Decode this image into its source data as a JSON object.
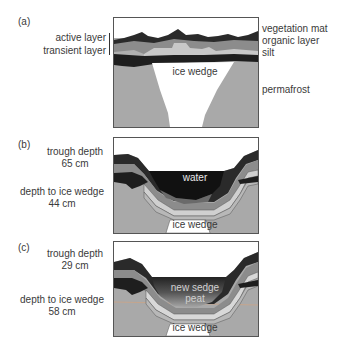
{
  "panels": [
    {
      "id": "a",
      "tag": "(a)",
      "left_labels": [
        "active layer",
        "transient layer"
      ],
      "right_labels": [
        "vegetation mat",
        "organic layer",
        "silt",
        "permafrost"
      ],
      "inner_labels": [
        "ice wedge"
      ]
    },
    {
      "id": "b",
      "tag": "(b)",
      "trough_depth_label": "trough depth",
      "trough_depth_value": "65 cm",
      "ice_depth_label": "depth to ice wedge",
      "ice_depth_value": "44 cm",
      "inner_labels": [
        "water",
        "ice wedge"
      ]
    },
    {
      "id": "c",
      "tag": "(c)",
      "trough_depth_label": "trough depth",
      "trough_depth_value": "29 cm",
      "ice_depth_label": "depth to ice wedge",
      "ice_depth_value": "58 cm",
      "inner_labels": [
        "new sedge",
        "peat",
        "ice wedge"
      ]
    }
  ],
  "colors": {
    "permafrost": "#a9a9a9",
    "vegetation": "#2a2a2a",
    "organic": "#8c8c8c",
    "silt_light": "#c8c8c8",
    "transient": "#1e1e1e",
    "ice": "#ffffff",
    "water": "#111111"
  }
}
